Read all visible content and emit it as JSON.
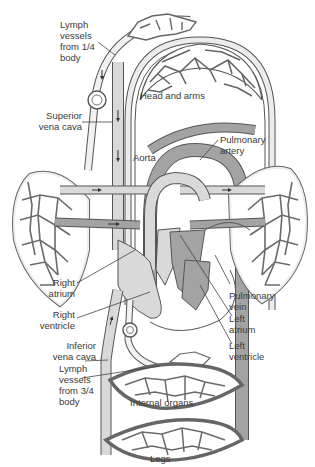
{
  "figure": {
    "top_caption_partial": "ɔ ɪɪɥ ɔɪ ɥɪ ɪɪɪɪ",
    "colors": {
      "outline": "#555555",
      "deoxygenated_fill": "#d9d9d9",
      "oxygenated_fill": "#a3a3a3",
      "capillary_fill": "#ffffff",
      "background": "#ffffff",
      "label_text": "#3a3a3a"
    },
    "regions": {
      "head_arms": "Head and arms",
      "internal_organs": "Internal organs",
      "legs": "Legs"
    },
    "labels": {
      "lymph_upper": "Lymph\nvessels\nfrom 1/4\nbody",
      "superior_vena_cava": "Superior\nvena cava",
      "aorta": "Aorta",
      "pulmonary_artery": "Pulmonary\nartery",
      "right_atrium": "Right\natrium",
      "right_ventricle": "Right\nventricle",
      "inferior_vena_cava": "Inferior\nvena cava",
      "lymph_lower": "Lymph\nvessels\nfrom 3/4\nbody",
      "pulmonary_vein": "Pulmonary\nvein",
      "left_atrium": "Left\natrium",
      "left_ventricle": "Left\nventricle"
    }
  }
}
